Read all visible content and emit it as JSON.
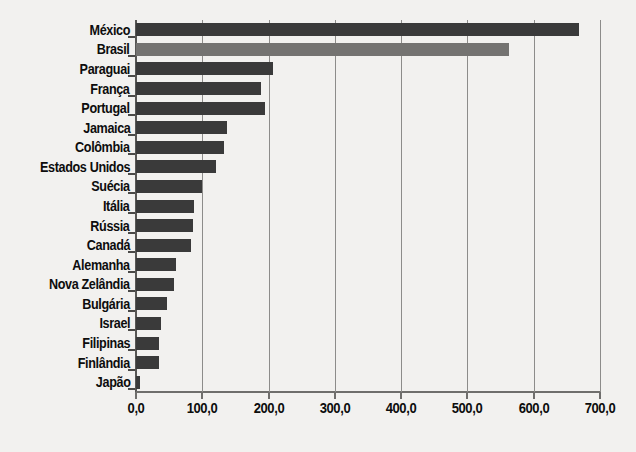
{
  "chart_data": {
    "type": "bar",
    "orientation": "horizontal",
    "title": "",
    "subtitle": "",
    "xlabel": "",
    "ylabel": "",
    "xlim": [
      0,
      700
    ],
    "xticks": [
      0,
      100,
      200,
      300,
      400,
      500,
      600,
      700
    ],
    "xtick_labels": [
      "0,0",
      "100,0",
      "200,0",
      "300,0",
      "400,0",
      "500,0",
      "600,0",
      "700,0"
    ],
    "grid": true,
    "grid_axis": "x",
    "legend": null,
    "decimal_separator": ",",
    "categories": [
      "México",
      "Brasil",
      "Paraguai",
      "França",
      "Portugal",
      "Jamaica",
      "Colômbia",
      "Estados Unidos",
      "Suécia",
      "Itália",
      "Rússia",
      "Canadá",
      "Alemanha",
      "Nova Zelândia",
      "Bulgária",
      "Israel",
      "Filipinas",
      "Finlândia",
      "Japão"
    ],
    "values": [
      668.0,
      562.0,
      206.0,
      188.0,
      194.0,
      137.0,
      133.0,
      120.0,
      100.0,
      88.0,
      86.0,
      83.0,
      60.0,
      57.0,
      47.0,
      38.0,
      34.0,
      35.0,
      6.0
    ],
    "bar_colors": [
      "#3a3a3a",
      "#747371",
      "#3a3a3a",
      "#3a3a3a",
      "#3a3a3a",
      "#3a3a3a",
      "#3a3a3a",
      "#3a3a3a",
      "#3a3a3a",
      "#3a3a3a",
      "#3a3a3a",
      "#3a3a3a",
      "#3a3a3a",
      "#3a3a3a",
      "#3a3a3a",
      "#3a3a3a",
      "#3a3a3a",
      "#3a3a3a",
      "#3a3a3a"
    ],
    "highlight_index": 1,
    "colors": {
      "background": "#f2f1ef",
      "bar_default": "#3a3a3a",
      "bar_highlight": "#747371",
      "axis": "#6f6e6c",
      "gridline": "#8d8c8a",
      "text": "#0d0d0d"
    }
  }
}
